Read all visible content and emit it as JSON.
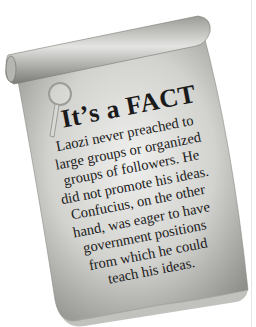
{
  "fact_box": {
    "title": "It’s a FACT",
    "lines": [
      "Laozi never preached to",
      "large groups or organized",
      "groups of followers.  He",
      "did not promote his ideas.",
      "Confucius, on the other",
      "hand, was eager to have",
      "government positions",
      "from which he could",
      "teach his ideas."
    ],
    "icon": "magnifying-glass-icon"
  },
  "colors": {
    "parchment_light": "#e8e8e6",
    "parchment_mid": "#bdbdba",
    "parchment_dark": "#8e8e8a",
    "text": "#1a1a1a"
  }
}
